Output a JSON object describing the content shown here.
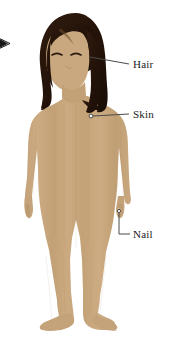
{
  "figure": {
    "background_color": "#ffffff"
  },
  "colors": {
    "skin": "#c8a87f",
    "skin_shadow": "#bb9a72",
    "skin_highlight": "#d2b48f",
    "hair": "#241309",
    "hair_highlight": "#3a2415",
    "leader_line": "#4a4a4a",
    "label_text": "#1a1a1a",
    "arrow": "#1a1a1a",
    "marker_stroke": "#4a4a4a",
    "marker_fill": "#ffffff"
  },
  "pointer": {
    "name": "left-arrow-indicator",
    "glyph": "arrow-right",
    "x": 4,
    "y": 43
  },
  "callouts": [
    {
      "id": "hair",
      "label": "Hair",
      "label_x": 133,
      "label_y": 59,
      "leader": {
        "style": "straight",
        "from_x": 90,
        "from_y": 57,
        "to_x": 129,
        "to_y": 64
      },
      "target": "hair"
    },
    {
      "id": "skin",
      "label": "Skin",
      "label_x": 133,
      "label_y": 109,
      "leader": {
        "style": "straight-with-dot",
        "from_x": 91,
        "from_y": 116,
        "to_x": 129,
        "to_y": 114
      },
      "target": "shoulder-skin",
      "marker": {
        "x": 91,
        "y": 116,
        "r": 1.8
      }
    },
    {
      "id": "nail",
      "label": "Nail",
      "label_x": 133,
      "label_y": 229,
      "leader": {
        "style": "elbow",
        "from_x": 119,
        "from_y": 212,
        "elbow_x": 119,
        "elbow_y": 234,
        "to_x": 129,
        "to_y": 234
      },
      "target": "fingernail",
      "marker": {
        "x": 119,
        "y": 212,
        "r": 1.6
      }
    }
  ],
  "body_parts": [
    {
      "name": "head",
      "label": "head"
    },
    {
      "name": "hair",
      "label": "hair"
    },
    {
      "name": "face",
      "label": "face"
    },
    {
      "name": "eye-left",
      "label": "left eye (closed)"
    },
    {
      "name": "eye-right",
      "label": "right eye (closed)"
    },
    {
      "name": "neck",
      "label": "neck"
    },
    {
      "name": "torso",
      "label": "torso"
    },
    {
      "name": "arm-left",
      "label": "left arm"
    },
    {
      "name": "arm-right",
      "label": "right arm"
    },
    {
      "name": "hand-left",
      "label": "left hand"
    },
    {
      "name": "hand-right",
      "label": "right hand"
    },
    {
      "name": "leg-left",
      "label": "left leg"
    },
    {
      "name": "leg-right",
      "label": "right leg"
    },
    {
      "name": "foot-left",
      "label": "left foot"
    },
    {
      "name": "foot-right",
      "label": "right foot"
    }
  ]
}
